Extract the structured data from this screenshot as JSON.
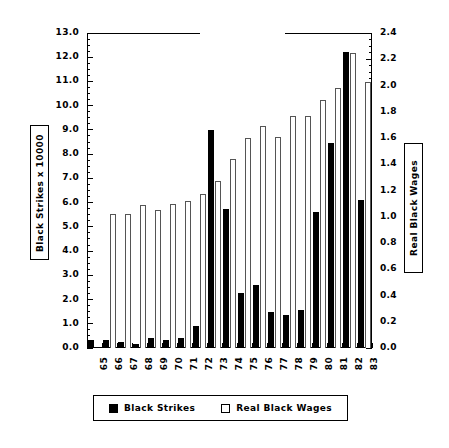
{
  "chart_data": {
    "type": "bar",
    "title": "",
    "xlabel": "",
    "ylabel": "Black Strikes x 10000",
    "ylabel_right": "Real Black Wages",
    "categories": [
      "65",
      "66",
      "67",
      "68",
      "69",
      "70",
      "71",
      "72",
      "73",
      "74",
      "75",
      "76",
      "77",
      "78",
      "79",
      "80",
      "81",
      "82",
      "83"
    ],
    "ylim": [
      0.0,
      13.0
    ],
    "ylim_right": [
      0.0,
      2.4
    ],
    "ytick_labels": [
      "0.0",
      "1.0",
      "2.0",
      "3.0",
      "4.0",
      "5.0",
      "6.0",
      "7.0",
      "8.0",
      "9.0",
      "10.0",
      "11.0",
      "12.0",
      "13.0"
    ],
    "ytick_values": [
      0.0,
      1.0,
      2.0,
      3.0,
      4.0,
      5.0,
      6.0,
      7.0,
      8.0,
      9.0,
      10.0,
      11.0,
      12.0,
      13.0
    ],
    "ytick_right_labels": [
      "0.0",
      "0.2",
      "0.4",
      "0.6",
      "0.8",
      "1.0",
      "1.2",
      "1.4",
      "1.6",
      "1.8",
      "2.0",
      "2.2",
      "2.4"
    ],
    "ytick_right_values": [
      0.0,
      0.2,
      0.4,
      0.6,
      0.8,
      1.0,
      1.2,
      1.4,
      1.6,
      1.8,
      2.0,
      2.2,
      2.4
    ],
    "grid": false,
    "legend_position": "bottom",
    "series": [
      {
        "name": "Black Strikes",
        "axis": "left",
        "style": "filled",
        "color": "#000000",
        "values": [
          0.35,
          0.32,
          0.25,
          0.17,
          0.42,
          0.33,
          0.4,
          0.9,
          9.0,
          5.75,
          2.25,
          2.6,
          1.48,
          1.35,
          1.55,
          5.6,
          8.45,
          12.2,
          6.1
        ]
      },
      {
        "name": "Real Black Wages",
        "axis": "right",
        "style": "open",
        "color": "#ffffff",
        "values": [
          null,
          1.02,
          1.02,
          1.09,
          1.05,
          1.1,
          1.12,
          1.17,
          1.27,
          1.44,
          1.6,
          1.69,
          1.61,
          1.77,
          1.77,
          1.89,
          1.98,
          2.25,
          2.03
        ]
      }
    ]
  },
  "legend": {
    "entries": [
      {
        "label": "Black Strikes",
        "swatch": "filled-square-icon"
      },
      {
        "label": "Real Black Wages",
        "swatch": "open-square-icon"
      }
    ]
  }
}
